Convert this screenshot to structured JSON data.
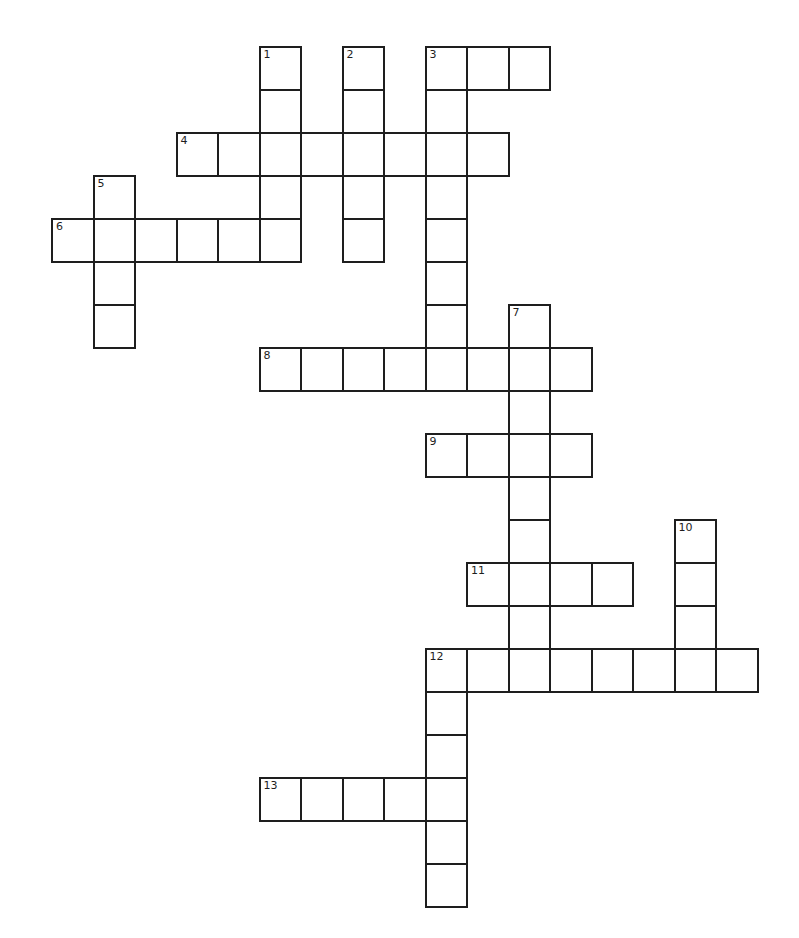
{
  "puzzle": {
    "type": "crossword",
    "cell_width": 41.5,
    "cell_height": 43,
    "origin_x": 52,
    "origin_y": 47,
    "line_color": "#1e1e1e",
    "background": "#ffffff",
    "entries": [
      {
        "number": "1",
        "direction": "down",
        "row": 0,
        "col": 5,
        "length": 5
      },
      {
        "number": "2",
        "direction": "down",
        "row": 0,
        "col": 7,
        "length": 5
      },
      {
        "number": "3",
        "direction": "across",
        "row": 0,
        "col": 9,
        "length": 3
      },
      {
        "number": "3",
        "direction": "down",
        "row": 0,
        "col": 9,
        "length": 8
      },
      {
        "number": "4",
        "direction": "across",
        "row": 2,
        "col": 3,
        "length": 8
      },
      {
        "number": "5",
        "direction": "down",
        "row": 3,
        "col": 1,
        "length": 4
      },
      {
        "number": "6",
        "direction": "across",
        "row": 4,
        "col": 0,
        "length": 6
      },
      {
        "number": "7",
        "direction": "down",
        "row": 6,
        "col": 11,
        "length": 9
      },
      {
        "number": "8",
        "direction": "across",
        "row": 7,
        "col": 5,
        "length": 8
      },
      {
        "number": "9",
        "direction": "across",
        "row": 9,
        "col": 9,
        "length": 4
      },
      {
        "number": "10",
        "direction": "down",
        "row": 11,
        "col": 15,
        "length": 4
      },
      {
        "number": "11",
        "direction": "across",
        "row": 12,
        "col": 10,
        "length": 4
      },
      {
        "number": "12",
        "direction": "across",
        "row": 14,
        "col": 9,
        "length": 8
      },
      {
        "number": "12",
        "direction": "down",
        "row": 14,
        "col": 9,
        "length": 6
      },
      {
        "number": "13",
        "direction": "across",
        "row": 17,
        "col": 5,
        "length": 5
      }
    ]
  }
}
